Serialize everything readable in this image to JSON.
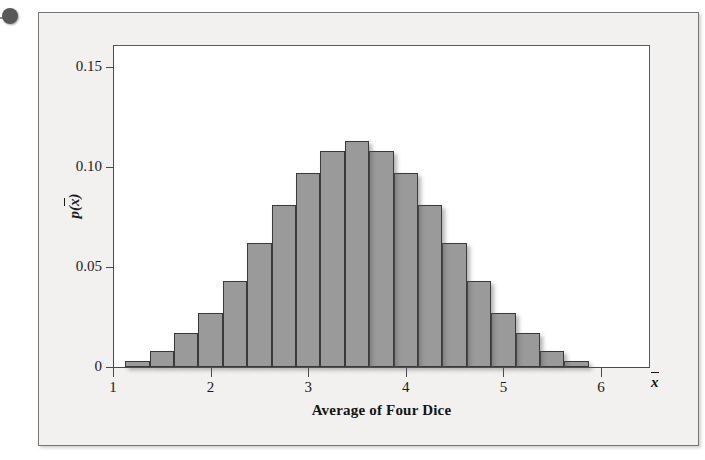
{
  "figure": {
    "tack_icon": "pushpin-dot",
    "background_color": "#f2f1ef",
    "bar_fill_color": "#9a9a9a",
    "bar_edge_color": "#3a3a3a"
  },
  "axes": {
    "y_title_base": "p(",
    "y_title_var": "x",
    "y_title_close": ")",
    "x_title": "Average of Four Dice",
    "x_axis_symbol": "x",
    "y_ticks": [
      "0.15",
      "0.10",
      "0.05",
      "0"
    ],
    "x_ticks": [
      "1",
      "2",
      "3",
      "4",
      "5",
      "6"
    ]
  },
  "chart_data": {
    "type": "bar",
    "title": "",
    "subtitle": "",
    "xlabel": "Average of Four Dice",
    "ylabel": "p(x̄)",
    "xlim": [
      1,
      6
    ],
    "ylim": [
      0,
      0.165
    ],
    "grid": false,
    "legend": null,
    "bin_width": 0.25,
    "x_tick_values": [
      1,
      2,
      3,
      4,
      5,
      6
    ],
    "y_tick_values": [
      0,
      0.05,
      0.1,
      0.15
    ],
    "y_tick_labels": [
      "0",
      "0.05",
      "0.10",
      "0.15"
    ],
    "note": "Sampling distribution of the mean of four fair dice; averages range 1.00 to 6.00 in steps of 0.25",
    "categories": [
      "1.25",
      "1.50",
      "1.75",
      "2.00",
      "2.25",
      "2.50",
      "2.75",
      "3.00",
      "3.25",
      "3.50",
      "3.75",
      "4.00",
      "4.25",
      "4.50",
      "4.75",
      "5.00",
      "5.25",
      "5.50",
      "5.75"
    ],
    "values": [
      0.003,
      0.008,
      0.017,
      0.027,
      0.043,
      0.062,
      0.081,
      0.097,
      0.108,
      0.113,
      0.108,
      0.097,
      0.081,
      0.062,
      0.043,
      0.027,
      0.017,
      0.008,
      0.003
    ],
    "bars": [
      {
        "center": 1.25,
        "value": 0.003
      },
      {
        "center": 1.5,
        "value": 0.008
      },
      {
        "center": 1.75,
        "value": 0.017
      },
      {
        "center": 2.0,
        "value": 0.027
      },
      {
        "center": 2.25,
        "value": 0.043
      },
      {
        "center": 2.5,
        "value": 0.062
      },
      {
        "center": 2.75,
        "value": 0.081
      },
      {
        "center": 3.0,
        "value": 0.097
      },
      {
        "center": 3.25,
        "value": 0.108
      },
      {
        "center": 3.5,
        "value": 0.113
      },
      {
        "center": 3.75,
        "value": 0.108
      },
      {
        "center": 4.0,
        "value": 0.097
      },
      {
        "center": 4.25,
        "value": 0.081
      },
      {
        "center": 4.5,
        "value": 0.062
      },
      {
        "center": 4.75,
        "value": 0.043
      },
      {
        "center": 5.0,
        "value": 0.027
      },
      {
        "center": 5.25,
        "value": 0.017
      },
      {
        "center": 5.5,
        "value": 0.008
      },
      {
        "center": 5.75,
        "value": 0.003
      }
    ]
  },
  "geometry": {
    "plot_left": 113,
    "plot_right": 650,
    "plot_top": 45,
    "y_zero_px": 367,
    "px_per_unit_x": 97.6,
    "px_per_0_05_y": 100,
    "x_origin_value": 1,
    "bar_pixel_width": 26.2,
    "first_bar_left_px": 148
  }
}
